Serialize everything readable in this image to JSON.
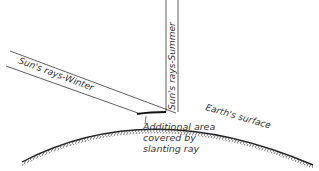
{
  "diagram": {
    "labels": {
      "winter": "Sun's rays-Winter",
      "summer": "Sun's rays-Summer",
      "surface": "Earth's surface",
      "additional_line1": "Additional area",
      "additional_line2": "covered by",
      "additional_line3": "slanting ray"
    },
    "colors": {
      "ink": "#333333",
      "background": "#ffffff"
    }
  }
}
